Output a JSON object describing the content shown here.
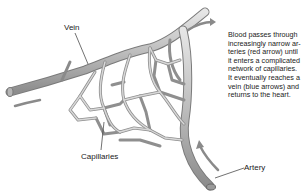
{
  "diagram": {
    "labels": {
      "vein": "Vein",
      "capillaries": "Capillaries",
      "artery": "Artery"
    },
    "caption_lines": [
      "Blood passes through",
      "increasingly narrow ar-",
      "teries (red arrow) until",
      "it enters a complicated",
      "network of capillaries.",
      "It eventually reaches a",
      "vein (blue arrows) and",
      "returns to the heart."
    ],
    "colors": {
      "vessel_fill": "#c9c9c9",
      "vessel_stroke": "#8a8a8a",
      "arrow": "#888888",
      "text": "#222222"
    },
    "arrows": [
      {
        "name": "vein-flow-arrow-left",
        "direction": "left"
      },
      {
        "name": "vein-flow-arrow-right",
        "direction": "right"
      },
      {
        "name": "artery-flow-arrow",
        "direction": "up"
      }
    ]
  }
}
